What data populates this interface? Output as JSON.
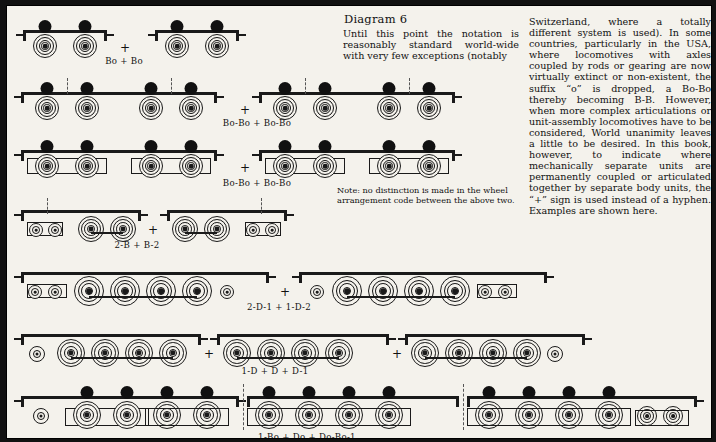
{
  "diagram": {
    "title": "Diagram 6"
  },
  "columns": {
    "middle": "Until this point the notation is reasonably standard world-wide with very few exceptions (notably",
    "right": "Switzerland, where a totally different system is used). In some countries, particularly in the USA, where locomotives with axles coupled by rods or gearing are now virtually extinct or non-existent, the suffix “o” is dropped, a Bo-Bo thereby becoming B-B. However, when more complex articulations or unit-assembly locomotives have to be considered, World unanimity leaves a little to be desired. In this book, however, to indicate where mechanically separate units are permanently coupled or articulated together by separate body units, the “+” sign is used instead of a hyphen. Examples are shown here."
  },
  "note": "Note: no distinction is made in the wheel arrangement code between the above two.",
  "separator": "+",
  "rows": [
    {
      "label": "Bo + Bo"
    },
    {
      "label": "Bo-Bo + Bo-Bo"
    },
    {
      "label": "Bo-Bo + Bo-Bo"
    },
    {
      "label": "2-B + B-2"
    },
    {
      "label": "2-D-1 + 1-D-2"
    },
    {
      "label": "1-D + D + D-1"
    },
    {
      "label": "1-Bo + Do + Do-Bo-1"
    }
  ],
  "colors": {
    "ink": "#111111",
    "paper": "#f4f2ec",
    "frame": "#000000"
  }
}
